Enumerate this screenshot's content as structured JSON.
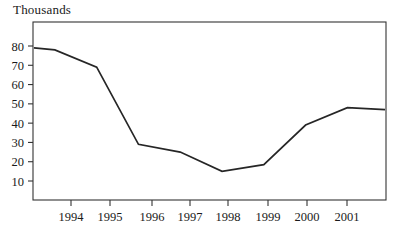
{
  "chart_data": {
    "type": "line",
    "title": "Thousands",
    "xlabel": "",
    "ylabel": "",
    "grid": false,
    "legend": null,
    "ylim": [
      0,
      85
    ],
    "yticks": [
      10,
      20,
      30,
      40,
      50,
      60,
      70,
      80
    ],
    "ytick_labels": [
      "10",
      "20",
      "30",
      "40",
      "50",
      "60",
      "70",
      "80"
    ],
    "xticks": [
      1994,
      1995,
      1996,
      1997,
      1998,
      1999,
      2000,
      2001
    ],
    "xtick_labels": [
      "1994",
      "1995",
      "1996",
      "1997",
      "1998",
      "1999",
      "2000",
      "2001"
    ],
    "x": [
      1993.5,
      1994,
      1995,
      1996,
      1997,
      1998,
      1999,
      2000,
      2001,
      2001.9
    ],
    "values": [
      79,
      78,
      69,
      29,
      25,
      15,
      18.5,
      39,
      48,
      47
    ],
    "series": [
      {
        "name": "Thousands",
        "values": [
          79,
          78,
          69,
          29,
          25,
          15,
          18.5,
          39,
          48,
          47
        ]
      }
    ],
    "line_color": "#262626",
    "axis_color": "#333333"
  },
  "geometry": {
    "plot_left": 33,
    "plot_right": 386,
    "plot_top": 22,
    "plot_bottom": 200,
    "y_value_top": 80,
    "y_pixel_top": 46,
    "y_value_bottom": 10,
    "y_pixel_bottom": 181,
    "x_tick_pixels": [
      71,
      110,
      152,
      190,
      228,
      268,
      307,
      347
    ],
    "x_pixel_first_point": 34,
    "x_pixel_last_point": 385
  }
}
